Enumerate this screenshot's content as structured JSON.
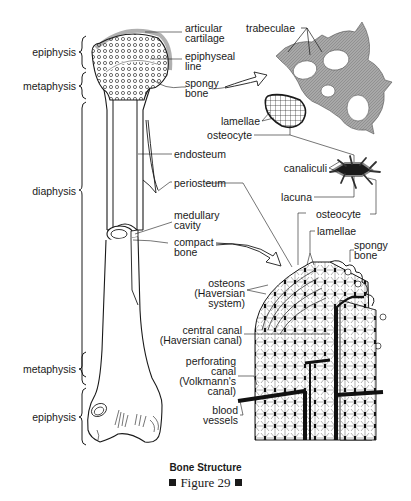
{
  "figure": {
    "title": "Bone Structure",
    "number_label": "Figure 29"
  },
  "regions_left": {
    "epiphysis_top": "epiphysis",
    "metaphysis_top": "metaphysis",
    "diaphysis": "diaphysis",
    "metaphysis_bottom": "metaphysis",
    "epiphysis_bottom": "epiphysis"
  },
  "labels_upper": {
    "articular_cartilage": "articular\ncartilage",
    "epiphyseal_line": "epiphyseal\nline",
    "spongy_bone": "spongy\nbone",
    "endosteum": "endosteum",
    "periosteum": "periosteum",
    "medullary_cavity": "medullary\ncavity",
    "compact_bone": "compact\nbone"
  },
  "labels_spongy_detail": {
    "trabeculae": "trabeculae",
    "lamellae": "lamellae",
    "osteocyte": "osteocyte"
  },
  "labels_osteocyte_detail": {
    "canaliculi": "canaliculi",
    "lacuna": "lacuna",
    "osteocyte": "osteocyte"
  },
  "labels_compact_detail": {
    "lamellae": "lamellae",
    "spongy_bone": "spongy\nbone",
    "osteons": "osteons\n(Haversian\nsystem)",
    "central_canal": "central canal\n(Haversian canal)",
    "perforating_canal": "perforating\ncanal\n(Volkmann's\ncanal)",
    "blood_vessels": "blood\nvessels"
  },
  "colors": {
    "ink": "#1a1a1a",
    "trabecula_fill": "#9a9a9a",
    "cartilage": "#b0b0b0",
    "background": "#ffffff"
  }
}
